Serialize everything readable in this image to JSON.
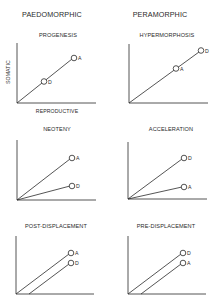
{
  "columns": [
    {
      "title": "PAEDOMORPHIC"
    },
    {
      "title": "PERAMORPHIC"
    }
  ],
  "axes": {
    "y_label": "SOMATIC",
    "x_label": "REPRODUCTIVE"
  },
  "panels": [
    {
      "title": "PROGENESIS",
      "points": [
        {
          "label": "A"
        },
        {
          "label": "D"
        }
      ]
    },
    {
      "title": "HYPERMORPHOSIS",
      "points": [
        {
          "label": "D"
        },
        {
          "label": "A"
        }
      ]
    },
    {
      "title": "NEOTENY",
      "points": [
        {
          "label": "A"
        },
        {
          "label": "D"
        }
      ]
    },
    {
      "title": "ACCELERATION",
      "points": [
        {
          "label": "D"
        },
        {
          "label": "A"
        }
      ]
    },
    {
      "title": "POST-DISPLACEMENT",
      "points": [
        {
          "label": "A"
        },
        {
          "label": "D"
        }
      ]
    },
    {
      "title": "PRE-DISPLACEMENT",
      "points": [
        {
          "label": "D"
        },
        {
          "label": "A"
        }
      ]
    }
  ],
  "colors": {
    "line": "#2a2a2a",
    "background": "#ffffff"
  }
}
